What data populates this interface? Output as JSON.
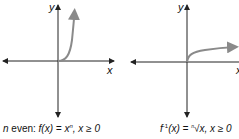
{
  "graphs": [
    {
      "axis_x_label": "x",
      "axis_y_label": "y",
      "caption_prefix": "n",
      "caption_text": " even: ",
      "caption_func": "f(x) = x",
      "caption_exp": "n",
      "caption_cond": ", x ≥ 0",
      "curve_color": "#8a8a8a"
    },
    {
      "axis_x_label": "x",
      "axis_y_label": "y",
      "caption_func": "f",
      "caption_exp": "-1",
      "caption_rest": "(x) = ",
      "caption_root_index": "n",
      "caption_root": "√x",
      "caption_cond": ", x ≥ 0",
      "curve_color": "#8a8a8a"
    }
  ]
}
